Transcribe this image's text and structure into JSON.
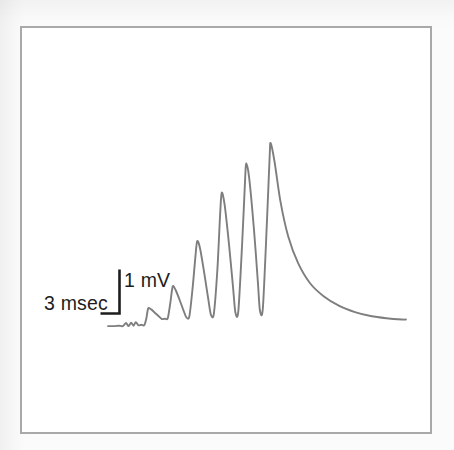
{
  "figure": {
    "kind": "electrophysiology-trace"
  },
  "scale_bars": {
    "time_label": "3 msec",
    "voltage_label": "1 mV",
    "time_value": 3,
    "time_unit": "msec",
    "voltage_value": 1,
    "voltage_unit": "mV"
  },
  "colors": {
    "trace": "#7e7e7e",
    "frame": "#a9a9a9",
    "text": "#1d1d1d",
    "plot_background": "#ffffff",
    "page_background": "#fbfbfb"
  },
  "chart_data": {
    "type": "line",
    "title": "",
    "subtitle": "",
    "xlabel": "Time",
    "ylabel": "Membrane potential",
    "xunit": "msec",
    "yunit": "mV",
    "grid": false,
    "legend": null,
    "axes_visible": false,
    "scale_bar_time_msec": 3,
    "scale_bar_voltage_mV": 1,
    "xlim": [
      0,
      15.2
    ],
    "ylim": [
      -0.15,
      4.4
    ],
    "baseline_mV": 0,
    "annotations": [
      {
        "text": "3 msec",
        "role": "horizontal-scale-bar"
      },
      {
        "text": "1 mV",
        "role": "vertical-scale-bar"
      }
    ],
    "peaks": {
      "count": 6,
      "time_msec": [
        2.05,
        3.3,
        4.55,
        5.8,
        7.05,
        8.3
      ],
      "amplitude_mV": [
        0.42,
        0.92,
        1.95,
        3.05,
        3.72,
        4.18
      ],
      "comment": "Successive EPSP peak amplitudes increase monotonically (short-term facilitation)"
    },
    "troughs": {
      "time_msec": [
        2.75,
        4.0,
        5.25,
        6.5,
        7.75
      ],
      "amplitude_mV": [
        0.18,
        0.22,
        0.28,
        0.33,
        0.38
      ]
    },
    "series": [
      {
        "name": "membrane potential",
        "x": [
          0.0,
          0.3,
          0.55,
          0.75,
          0.92,
          1.05,
          1.18,
          1.3,
          1.42,
          1.55,
          1.7,
          1.85,
          1.95,
          2.05,
          2.2,
          2.4,
          2.6,
          2.75,
          2.9,
          3.05,
          3.18,
          3.3,
          3.45,
          3.65,
          3.85,
          4.0,
          4.15,
          4.32,
          4.45,
          4.55,
          4.7,
          4.92,
          5.12,
          5.25,
          5.4,
          5.58,
          5.72,
          5.8,
          5.95,
          6.18,
          6.38,
          6.5,
          6.65,
          6.85,
          7.0,
          7.05,
          7.2,
          7.45,
          7.65,
          7.75,
          7.9,
          8.1,
          8.25,
          8.3,
          8.5,
          8.8,
          9.2,
          9.7,
          10.3,
          11.0,
          11.8,
          12.6,
          13.4,
          14.2,
          15.0,
          15.2
        ],
        "y": [
          0.02,
          0.02,
          0.03,
          0.02,
          0.09,
          0.02,
          0.1,
          0.03,
          0.11,
          0.04,
          0.05,
          0.04,
          0.18,
          0.42,
          0.4,
          0.32,
          0.24,
          0.18,
          0.19,
          0.2,
          0.55,
          0.92,
          0.84,
          0.62,
          0.38,
          0.22,
          0.24,
          0.9,
          1.55,
          1.95,
          1.78,
          1.2,
          0.62,
          0.28,
          0.3,
          1.3,
          2.55,
          3.05,
          2.78,
          1.85,
          0.9,
          0.33,
          0.36,
          1.95,
          3.4,
          3.72,
          3.4,
          2.2,
          1.0,
          0.38,
          0.42,
          2.3,
          3.9,
          4.18,
          3.75,
          2.85,
          2.05,
          1.45,
          1.0,
          0.7,
          0.48,
          0.34,
          0.25,
          0.2,
          0.17,
          0.17
        ],
        "color": "#7e7e7e"
      }
    ]
  }
}
